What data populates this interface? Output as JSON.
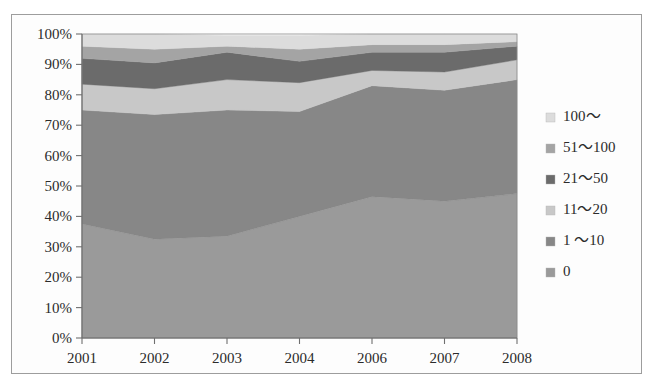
{
  "figure": {
    "background_color": "#ffffff",
    "frame_color": "#9d9d9d",
    "axis_color": "#6f6f6f",
    "text_color": "#2b2b2b"
  },
  "chart_data": {
    "type": "area",
    "stacked": true,
    "stack_mode": "percent",
    "title": "",
    "subtitle": "",
    "xlabel": "",
    "ylabel": "",
    "grid": false,
    "legend_position": "right",
    "categories": [
      "2001",
      "2002",
      "2003",
      "2004",
      "2006",
      "2007",
      "2008"
    ],
    "x_tick_labels": [
      "2001",
      "2002",
      "2003",
      "2004",
      "2006",
      "2007",
      "2008"
    ],
    "y_tick_labels": [
      "0%",
      "10%",
      "20%",
      "30%",
      "40%",
      "50%",
      "60%",
      "70%",
      "80%",
      "90%",
      "100%"
    ],
    "y_tick_values": [
      0,
      10,
      20,
      30,
      40,
      50,
      60,
      70,
      80,
      90,
      100
    ],
    "ylim": [
      0,
      100
    ],
    "series": [
      {
        "name": "0",
        "legend_label": "0",
        "color": "#9a9a9a",
        "values": [
          37.5,
          32.5,
          33.5,
          40.0,
          46.5,
          45.0,
          47.5
        ]
      },
      {
        "name": "1 ~ 10",
        "legend_label": "1 ～10",
        "color": "#878787",
        "values": [
          37.5,
          41.0,
          41.5,
          34.5,
          36.5,
          36.5,
          37.5
        ]
      },
      {
        "name": "11 ~ 20",
        "legend_label": "11～20",
        "color": "#c8c8c8",
        "values": [
          8.5,
          8.5,
          10.0,
          9.5,
          5.0,
          6.0,
          6.5
        ]
      },
      {
        "name": "21 ~ 50",
        "legend_label": "21～50",
        "color": "#6b6b6b",
        "values": [
          8.5,
          8.5,
          9.0,
          7.0,
          6.0,
          6.5,
          4.5
        ]
      },
      {
        "name": "51 ~ 100",
        "legend_label": "51～100",
        "color": "#a4a4a4",
        "values": [
          4.0,
          4.5,
          2.0,
          4.0,
          2.5,
          2.5,
          1.5
        ]
      },
      {
        "name": "100 ~",
        "legend_label": "100～",
        "color": "#dcdcdc",
        "values": [
          4.0,
          5.0,
          3.5,
          4.5,
          3.5,
          3.5,
          2.5
        ]
      }
    ],
    "legend_entries": [
      {
        "label": "100～",
        "color": "#dcdcdc"
      },
      {
        "label": "51～100",
        "color": "#a4a4a4"
      },
      {
        "label": "21～50",
        "color": "#6b6b6b"
      },
      {
        "label": "11～20",
        "color": "#c8c8c8"
      },
      {
        "label": "1 ～10",
        "color": "#878787"
      },
      {
        "label": "0",
        "color": "#9a9a9a"
      }
    ]
  }
}
